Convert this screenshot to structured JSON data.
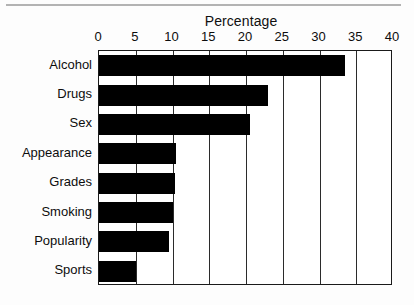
{
  "chart_data": {
    "type": "bar",
    "orientation": "horizontal",
    "title": "Percentage",
    "xlabel": "",
    "ylabel": "",
    "categories": [
      "Alcohol",
      "Drugs",
      "Sex",
      "Appearance",
      "Grades",
      "Smoking",
      "Popularity",
      "Sports"
    ],
    "values": [
      33.5,
      23,
      20.5,
      10.5,
      10.3,
      10,
      9.5,
      5
    ],
    "xlim": [
      0,
      40
    ],
    "xticks": [
      0,
      5,
      10,
      15,
      20,
      25,
      30,
      35,
      40
    ],
    "xtick_labels": [
      "0",
      "5",
      "10",
      "15",
      "20",
      "25",
      "30",
      "35",
      "40"
    ],
    "grid": "vertical",
    "legend": "none",
    "bar_color": "#000000",
    "frame_color": "#1a1a1a"
  }
}
